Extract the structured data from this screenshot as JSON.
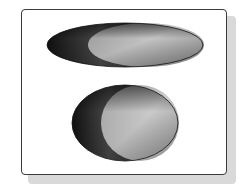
{
  "figure": {
    "frame": {
      "border_color": "#3a3a3a",
      "shadow_color": "#d9d9d9",
      "background": "#ffffff"
    },
    "shapes": [
      {
        "name": "oblate-spheroid",
        "cx": 125,
        "cy": 45,
        "rx": 78,
        "ry": 22,
        "lit_cx": 146,
        "lit_rx": 58,
        "meridians": 8,
        "latitude_spacing": 3.5,
        "dark_color": "#1c1c1c",
        "mid_color": "#5a5a5a",
        "light_color": "#b8b8b8"
      },
      {
        "name": "near-spherical-ellipsoid",
        "cx": 125,
        "cy": 123,
        "rx": 53,
        "ry": 38,
        "lit_cx": 140,
        "lit_rx": 39,
        "meridians": 8,
        "latitude_spacing": 3.5,
        "dark_color": "#1c1c1c",
        "mid_color": "#5a5a5a",
        "light_color": "#bdbdbd"
      }
    ]
  }
}
